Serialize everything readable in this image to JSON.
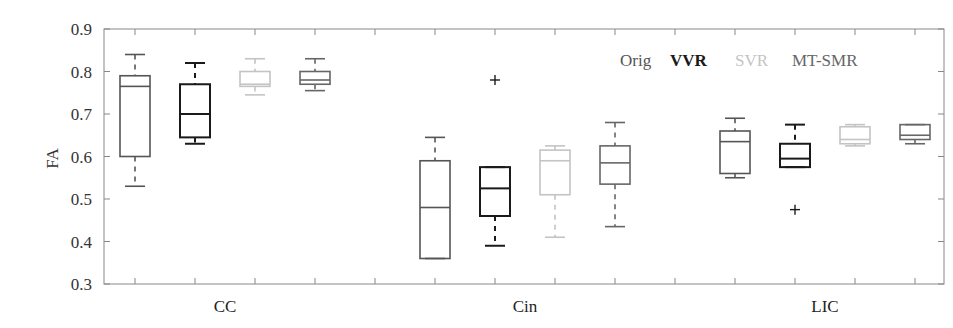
{
  "chart_data": {
    "type": "boxplot",
    "title": "",
    "xlabel": "",
    "ylabel": "FA",
    "ylim": [
      0.3,
      0.9
    ],
    "yticks": [
      0.3,
      0.4,
      0.5,
      0.6,
      0.7,
      0.8,
      0.9
    ],
    "ytick_labels": [
      "0.3",
      "0.4",
      "0.5",
      "0.6",
      "0.7",
      "0.8",
      "0.9"
    ],
    "grid": false,
    "legend_position": "top-right (inside)",
    "categories": [
      "CC",
      "Cin",
      "LIC"
    ],
    "series": [
      {
        "name": "Orig",
        "color": "#555555",
        "boxes": [
          {
            "category": "CC",
            "min": 0.53,
            "q1": 0.6,
            "median": 0.765,
            "q3": 0.79,
            "max": 0.84,
            "outliers": []
          },
          {
            "category": "Cin",
            "min": 0.36,
            "q1": 0.36,
            "median": 0.48,
            "q3": 0.59,
            "max": 0.645,
            "outliers": []
          },
          {
            "category": "LIC",
            "min": 0.55,
            "q1": 0.56,
            "median": 0.635,
            "q3": 0.66,
            "max": 0.69,
            "outliers": []
          }
        ]
      },
      {
        "name": "VVR",
        "color": "#1a1a1a",
        "boxes": [
          {
            "category": "CC",
            "min": 0.63,
            "q1": 0.645,
            "median": 0.7,
            "q3": 0.77,
            "max": 0.82,
            "outliers": []
          },
          {
            "category": "Cin",
            "min": 0.39,
            "q1": 0.46,
            "median": 0.525,
            "q3": 0.575,
            "max": 0.575,
            "outliers": [
              0.78
            ]
          },
          {
            "category": "LIC",
            "min": 0.575,
            "q1": 0.575,
            "median": 0.595,
            "q3": 0.63,
            "max": 0.675,
            "outliers": [
              0.475
            ]
          }
        ]
      },
      {
        "name": "SVR",
        "color": "#c4c4c4",
        "boxes": [
          {
            "category": "CC",
            "min": 0.745,
            "q1": 0.765,
            "median": 0.77,
            "q3": 0.8,
            "max": 0.83,
            "outliers": []
          },
          {
            "category": "Cin",
            "min": 0.41,
            "q1": 0.51,
            "median": 0.59,
            "q3": 0.615,
            "max": 0.625,
            "outliers": []
          },
          {
            "category": "LIC",
            "min": 0.625,
            "q1": 0.63,
            "median": 0.64,
            "q3": 0.67,
            "max": 0.675,
            "outliers": []
          }
        ]
      },
      {
        "name": "MT-SMR",
        "color": "#666666",
        "boxes": [
          {
            "category": "CC",
            "min": 0.755,
            "q1": 0.77,
            "median": 0.78,
            "q3": 0.8,
            "max": 0.83,
            "outliers": []
          },
          {
            "category": "Cin",
            "min": 0.435,
            "q1": 0.535,
            "median": 0.585,
            "q3": 0.625,
            "max": 0.68,
            "outliers": []
          },
          {
            "category": "LIC",
            "min": 0.63,
            "q1": 0.64,
            "median": 0.65,
            "q3": 0.675,
            "max": 0.675,
            "outliers": []
          }
        ]
      }
    ]
  }
}
